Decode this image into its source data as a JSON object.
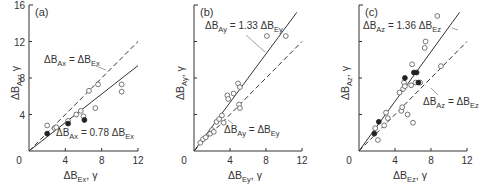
{
  "chart_data": [
    {
      "type": "scatter",
      "panel_label": "(a)",
      "xlabel": "ΔB_Ex, γ",
      "xlabel_main": "ΔB",
      "xlabel_sub": "Ex",
      "xlabel_tail": ", γ",
      "ylabel": "ΔB_Ax, γ",
      "ylabel_main": "ΔB",
      "ylabel_sub": "Ax",
      "ylabel_tail": ", γ",
      "xlim": [
        0,
        12
      ],
      "ylim": [
        0,
        16
      ],
      "xticks": [
        0,
        4,
        8,
        12
      ],
      "xtick_labels": [
        "0",
        "4",
        "8",
        "12"
      ],
      "yticks": [
        0,
        4,
        8,
        12,
        16
      ],
      "ytick_labels": [
        "0",
        "4",
        "8",
        "12",
        "16"
      ],
      "grid": false,
      "lines": [
        {
          "name": "ΔB_Ax = 0.78 ΔB_Ex",
          "slope": 0.78,
          "style": "solid",
          "label_main": "ΔB",
          "label_sub": "Ax",
          "label_mid": " = 0.78 ΔB",
          "label_sub2": "Ex"
        },
        {
          "name": "ΔB_Ax = ΔB_Ex",
          "slope": 1.0,
          "style": "dashed",
          "label_main": "ΔB",
          "label_sub": "Ax",
          "label_mid": " = ΔB",
          "label_sub2": "Ex"
        }
      ],
      "series": [
        {
          "name": "open",
          "marker": "open-circle",
          "points": [
            [
              2.0,
              2.8
            ],
            [
              2.8,
              2.5
            ],
            [
              3.0,
              2.6
            ],
            [
              4.3,
              3.3
            ],
            [
              5.2,
              4.0
            ],
            [
              5.7,
              4.4
            ],
            [
              6.0,
              3.8
            ],
            [
              6.6,
              6.6
            ],
            [
              7.3,
              4.7
            ],
            [
              7.6,
              7.3
            ],
            [
              10.2,
              7.3
            ],
            [
              10.2,
              6.5
            ]
          ]
        },
        {
          "name": "filled",
          "marker": "filled-circle",
          "points": [
            [
              2.0,
              1.9
            ],
            [
              4.3,
              3.0
            ],
            [
              6.1,
              3.4
            ]
          ]
        }
      ]
    },
    {
      "type": "scatter",
      "panel_label": "(b)",
      "xlabel": "ΔB_Ey, γ",
      "xlabel_main": "ΔB",
      "xlabel_sub": "Ey",
      "xlabel_tail": ", γ",
      "ylabel": "ΔB_Ay, γ",
      "ylabel_main": "ΔB",
      "ylabel_sub": "Ay",
      "ylabel_tail": ", γ",
      "xlim": [
        0,
        12
      ],
      "ylim": [
        0,
        16
      ],
      "xticks": [
        0,
        4,
        8,
        12
      ],
      "xtick_labels": [
        "0",
        "4",
        "8",
        "12"
      ],
      "yticks": [
        0,
        4,
        8,
        12,
        16
      ],
      "ytick_labels": [
        "0",
        "",
        "",
        "",
        ""
      ],
      "grid": false,
      "lines": [
        {
          "name": "ΔB_Ay = 1.33 ΔB_Ey",
          "slope": 1.33,
          "style": "solid",
          "label_main": "ΔB",
          "label_sub": "Ay",
          "label_mid": " = 1.33 ΔB",
          "label_sub2": "Ey"
        },
        {
          "name": "ΔB_Ay = ΔB_Ey",
          "slope": 1.0,
          "style": "dashed",
          "label_main": "ΔB",
          "label_sub": "Ay",
          "label_mid": " = ΔB",
          "label_sub2": "Ey"
        }
      ],
      "series": [
        {
          "name": "open",
          "marker": "open-circle",
          "points": [
            [
              0.7,
              0.9
            ],
            [
              1.0,
              1.3
            ],
            [
              1.3,
              1.5
            ],
            [
              1.8,
              1.9
            ],
            [
              2.0,
              2.3
            ],
            [
              2.2,
              2.1
            ],
            [
              2.5,
              3.2
            ],
            [
              2.8,
              3.5
            ],
            [
              3.1,
              3.9
            ],
            [
              3.3,
              3.1
            ],
            [
              3.7,
              6.1
            ],
            [
              3.8,
              5.7
            ],
            [
              4.4,
              6.3
            ],
            [
              4.9,
              7.4
            ],
            [
              5.0,
              5.1
            ],
            [
              5.1,
              4.7
            ],
            [
              5.1,
              7.0
            ],
            [
              8.1,
              12.6
            ],
            [
              10.2,
              12.6
            ]
          ]
        },
        {
          "name": "filled",
          "marker": "filled-circle",
          "points": []
        }
      ]
    },
    {
      "type": "scatter",
      "panel_label": "(c)",
      "xlabel": "ΔB_Ez, γ",
      "xlabel_main": "ΔB",
      "xlabel_sub": "Ez",
      "xlabel_tail": ", γ",
      "ylabel": "ΔB_Az, γ",
      "ylabel_main": "ΔB",
      "ylabel_sub": "Az",
      "ylabel_tail": ", γ",
      "xlim": [
        0,
        12
      ],
      "ylim": [
        0,
        16
      ],
      "xticks": [
        0,
        4,
        8,
        12
      ],
      "xtick_labels": [
        "0",
        "4",
        "8",
        "12"
      ],
      "yticks": [
        0,
        4,
        8,
        12,
        16
      ],
      "ytick_labels": [
        "0",
        "",
        "",
        "",
        ""
      ],
      "grid": false,
      "lines": [
        {
          "name": "ΔB_Az = 1.36 ΔB_Ez",
          "slope": 1.36,
          "style": "solid",
          "label_main": "ΔB",
          "label_sub": "Az",
          "label_mid": " = 1.36 ΔB",
          "label_sub2": "Ez"
        },
        {
          "name": "ΔB_Az = ΔB_Ez",
          "slope": 1.0,
          "style": "dashed",
          "label_main": "ΔB",
          "label_sub": "Az",
          "label_mid": " = ΔB",
          "label_sub2": "Ez"
        }
      ],
      "series": [
        {
          "name": "open",
          "marker": "open-circle",
          "points": [
            [
              1.8,
              2.5
            ],
            [
              2.1,
              1.2
            ],
            [
              2.8,
              2.8
            ],
            [
              3.0,
              4.2
            ],
            [
              3.2,
              3.6
            ],
            [
              4.5,
              6.4
            ],
            [
              4.7,
              4.4
            ],
            [
              4.8,
              4.8
            ],
            [
              4.9,
              6.8
            ],
            [
              5.0,
              7.5
            ],
            [
              5.1,
              7.1
            ],
            [
              5.4,
              4.0
            ],
            [
              5.8,
              7.2
            ],
            [
              5.9,
              9.5
            ],
            [
              6.0,
              3.1
            ],
            [
              6.3,
              7.5
            ],
            [
              6.8,
              7.5
            ],
            [
              7.3,
              11.3
            ],
            [
              7.4,
              12.0
            ],
            [
              8.7,
              14.8
            ],
            [
              9.1,
              9.3
            ]
          ]
        },
        {
          "name": "filled",
          "marker": "filled-circle",
          "points": [
            [
              1.7,
              1.9
            ],
            [
              2.2,
              3.2
            ],
            [
              5.1,
              8.0
            ],
            [
              6.1,
              8.6
            ],
            [
              6.4,
              8.6
            ],
            [
              6.6,
              7.5
            ]
          ]
        }
      ]
    }
  ],
  "panels_layout": [
    {
      "ox": 29,
      "oy": 151,
      "x12": 138,
      "y16": 5
    },
    {
      "ox": 194,
      "oy": 151,
      "x12": 302,
      "y16": 5
    },
    {
      "ox": 359,
      "oy": 151,
      "x12": 467,
      "y16": 5
    }
  ],
  "annotations": [
    {
      "panel": 0,
      "line": 1,
      "tx": 44,
      "ty": 63,
      "lx1": 96,
      "ly1": 66,
      "lx2": 106,
      "ly2": 70
    },
    {
      "panel": 0,
      "line": 0,
      "tx": 56,
      "ty": 136,
      "lx1": 0,
      "ly1": 0,
      "lx2": 0,
      "ly2": 0
    },
    {
      "panel": 1,
      "line": 0,
      "tx": 205,
      "ty": 29,
      "lx1": 246,
      "ly1": 35,
      "lx2": 265,
      "ly2": 52
    },
    {
      "panel": 1,
      "line": 1,
      "tx": 224,
      "ty": 133,
      "lx1": 233,
      "ly1": 124,
      "lx2": 228,
      "ly2": 120
    },
    {
      "panel": 2,
      "line": 0,
      "tx": 363,
      "ty": 29,
      "lx1": 452,
      "ly1": 28,
      "lx2": 458,
      "ly2": 30
    },
    {
      "panel": 2,
      "line": 1,
      "tx": 423,
      "ty": 105,
      "lx1": 438,
      "ly1": 95,
      "lx2": 431,
      "ly2": 88
    }
  ]
}
